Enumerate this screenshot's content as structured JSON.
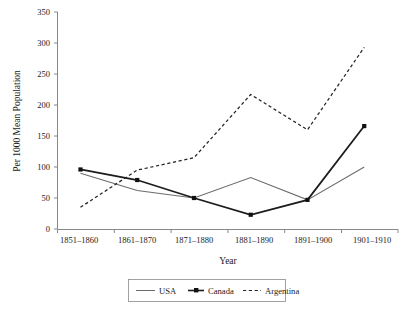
{
  "chart_data": {
    "type": "line",
    "title": "",
    "xlabel": "Year",
    "ylabel": "Per 1000 Mean Population",
    "categories": [
      "1851–1860",
      "1861–1870",
      "1871–1880",
      "1881–1890",
      "1891–1900",
      "1901–1910"
    ],
    "ylim": [
      0,
      350
    ],
    "yticks": [
      0,
      50,
      100,
      150,
      200,
      250,
      300,
      350
    ],
    "ytick_labels": [
      "0",
      "50",
      "100",
      "150",
      "200",
      "250",
      "300",
      "350"
    ],
    "grid": false,
    "legend_position": "bottom",
    "series": [
      {
        "name": "USA",
        "style": "solid-thin",
        "color": "#6b6b6b",
        "marker": "none",
        "values": [
          90,
          62,
          50,
          83,
          47,
          100
        ]
      },
      {
        "name": "Canada",
        "style": "solid-thick",
        "color": "#1c1c1c",
        "marker": "square",
        "values": [
          96,
          79,
          50,
          23,
          47,
          166
        ]
      },
      {
        "name": "Argentina",
        "style": "dashed",
        "color": "#242424",
        "marker": "none",
        "values": [
          35,
          95,
          115,
          217,
          160,
          293
        ]
      }
    ]
  },
  "legend": {
    "items": [
      {
        "label": "USA",
        "swatch": "line-solid-thin"
      },
      {
        "label": "Canada",
        "swatch": "line-solid-marker"
      },
      {
        "label": "Argentina",
        "swatch": "line-dashed"
      }
    ]
  }
}
